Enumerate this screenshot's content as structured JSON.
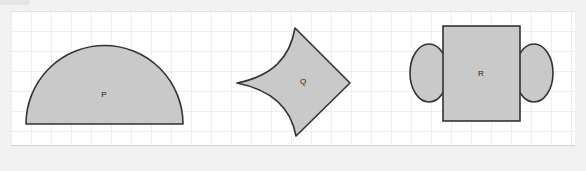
{
  "canvas": {
    "width": 586,
    "height": 171,
    "outer_background": "#f1f1f1",
    "panel_background": "#ffffff",
    "panel": {
      "x": 11,
      "y": 11,
      "width": 564,
      "height": 135
    }
  },
  "grid": {
    "visible": true,
    "cell_size": 20,
    "line_color": "#dcdcdc",
    "accent_line_color": "#cfcfcf"
  },
  "style": {
    "shape_fill": "#c9c9c9",
    "shape_stroke": "#333333",
    "shape_stroke_width": 1.6,
    "label_color": "#222222",
    "label_font_size": 8
  },
  "figure": {
    "type": "geometry-shapes",
    "shape_count": 3,
    "shapes": [
      {
        "id": "P",
        "label": "P",
        "name": "semicircle",
        "description": "Half disc with flat horizontal base at the bottom and a semicircular arc on top.",
        "fill": "#c9c9c9",
        "stroke": "#333333",
        "bbox": {
          "x": 26,
          "y": 45,
          "width": 157,
          "height": 79
        },
        "center": {
          "x": 104.5,
          "y": 124
        },
        "radius": 78.5,
        "label_position": {
          "x": 104,
          "y": 95
        },
        "path": "M 26 124 A 78.5 78.5 0 0 1 183 124 Z"
      },
      {
        "id": "Q",
        "label": "Q",
        "name": "concave-kite",
        "description": "Four-pointed kite: two concave (inward curving) arcs on the upper-left and lower-left, two straight edges on the right forming a point.",
        "fill": "#c9c9c9",
        "stroke": "#333333",
        "bbox": {
          "x": 237,
          "y": 28,
          "width": 113,
          "height": 108
        },
        "points": {
          "left": {
            "x": 237,
            "y": 83
          },
          "top": {
            "x": 295,
            "y": 28
          },
          "right": {
            "x": 350,
            "y": 83
          },
          "bottom": {
            "x": 296,
            "y": 136
          }
        },
        "label_position": {
          "x": 303,
          "y": 82
        },
        "path": "M 295 28 Q 288 72 237 83 Q 288 94 296 136 L 350 83 Z"
      },
      {
        "id": "R",
        "label": "R",
        "name": "rectangle-with-two-ellipses",
        "description": "Upright rectangle with an ellipse overlapping the middle of the left edge and another overlapping the middle of the right edge.",
        "fill": "#c9c9c9",
        "stroke": "#333333",
        "bbox": {
          "x": 411,
          "y": 26,
          "width": 141,
          "height": 95
        },
        "rect": {
          "x": 443,
          "y": 26,
          "width": 77,
          "height": 95
        },
        "ellipse_left": {
          "cx": 429,
          "cy": 73,
          "rx": 19,
          "ry": 29
        },
        "ellipse_right": {
          "cx": 534,
          "cy": 73,
          "rx": 19,
          "ry": 29
        },
        "label_position": {
          "x": 481,
          "y": 74
        }
      }
    ]
  }
}
